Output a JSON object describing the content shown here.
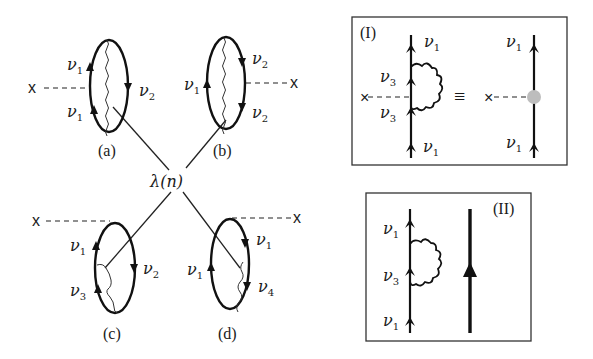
{
  "figure": {
    "center_label": "λ(n)",
    "diagrams": [
      {
        "id": "a",
        "caption": "(a)",
        "external": "x",
        "labels": [
          {
            "main": "ν",
            "sub": "1"
          },
          {
            "main": "ν",
            "sub": "2"
          },
          {
            "main": "ν",
            "sub": "1"
          }
        ]
      },
      {
        "id": "b",
        "caption": "(b)",
        "external": "x",
        "labels": [
          {
            "main": "ν",
            "sub": "1"
          },
          {
            "main": "ν",
            "sub": "2"
          },
          {
            "main": "ν",
            "sub": "2"
          }
        ]
      },
      {
        "id": "c",
        "caption": "(c)",
        "external": "x",
        "labels": [
          {
            "main": "ν",
            "sub": "1"
          },
          {
            "main": "ν",
            "sub": "2"
          },
          {
            "main": "ν",
            "sub": "3"
          }
        ]
      },
      {
        "id": "d",
        "caption": "(d)",
        "external": "x",
        "labels": [
          {
            "main": "ν",
            "sub": "1"
          },
          {
            "main": "ν",
            "sub": "1"
          },
          {
            "main": "ν",
            "sub": "4"
          }
        ]
      }
    ],
    "panels": [
      {
        "id": "I",
        "title": "(I)",
        "equiv_symbol": "≡",
        "left_labels": [
          {
            "main": "ν",
            "sub": "1"
          },
          {
            "main": "ν",
            "sub": "3"
          },
          {
            "main": "ν",
            "sub": "3"
          },
          {
            "main": "ν",
            "sub": "1"
          }
        ],
        "right_labels": [
          {
            "main": "ν",
            "sub": "1"
          },
          {
            "main": "ν",
            "sub": "1"
          }
        ],
        "cross": "×",
        "blob_color": "#bdbdbd"
      },
      {
        "id": "II",
        "title": "(II)",
        "left_labels": [
          {
            "main": "ν",
            "sub": "1"
          },
          {
            "main": "ν",
            "sub": "3"
          },
          {
            "main": "ν",
            "sub": "1"
          }
        ]
      }
    ]
  }
}
